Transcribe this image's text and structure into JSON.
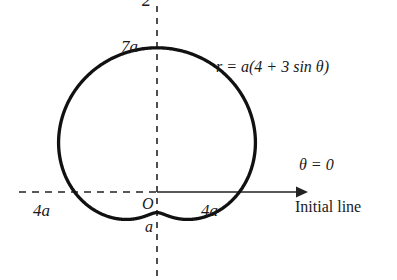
{
  "figure": {
    "kind": "polar-curve-limacon",
    "background_color": "#ffffff",
    "stroke_color": "#111111",
    "axis_color": "#222222",
    "labels": {
      "pi_over_2": "2",
      "max_radius": "7a",
      "equation": "r = a(4 + 3 sin θ)",
      "theta_zero": "θ = 0",
      "initial_line": "Initial line",
      "left_intercept": "4a",
      "origin": "O",
      "right_intercept": "4a",
      "min_radius": "a"
    }
  },
  "chart_data": {
    "type": "line",
    "title": "",
    "subtitle": "",
    "coordinate_system": "polar",
    "equation": "r = a(4 + 3 sin θ)",
    "xlabel": "Initial line",
    "ylabel": "",
    "grid": false,
    "legend_position": "none",
    "axes": [
      {
        "name": "initial-line",
        "label": "θ = 0",
        "direction": "horizontal",
        "style": "dashed-left-solid-right-arrow"
      },
      {
        "name": "pi-over-2-axis",
        "label": "2",
        "direction": "vertical",
        "style": "dashed"
      }
    ],
    "annotations": [
      {
        "text": "7a",
        "meaning": "r at θ = π/2",
        "r": 7,
        "theta_deg": 90
      },
      {
        "text": "4a",
        "meaning": "r at θ = π",
        "r": 4,
        "theta_deg": 180
      },
      {
        "text": "4a",
        "meaning": "r at θ = 0",
        "r": 4,
        "theta_deg": 0
      },
      {
        "text": "a",
        "meaning": "r at θ = 3π/2 (minimum)",
        "r": 1,
        "theta_deg": 270
      },
      {
        "text": "O",
        "meaning": "pole / origin",
        "r": 0,
        "theta_deg": 0
      },
      {
        "text": "r = a(4 + 3 sin θ)",
        "meaning": "curve equation",
        "r": null,
        "theta_deg": null
      }
    ],
    "parameters": {
      "a_coefficient": 4,
      "b_coefficient": 3,
      "scale_symbol": "a"
    },
    "theta_range_deg": [
      0,
      360
    ],
    "r_range": [
      1,
      7
    ],
    "series": [
      {
        "name": "r = a(4 + 3 sin θ)",
        "theta_deg": [
          0,
          15,
          30,
          45,
          60,
          75,
          90,
          105,
          120,
          135,
          150,
          165,
          180,
          195,
          210,
          225,
          240,
          255,
          270,
          285,
          300,
          315,
          330,
          345,
          360
        ],
        "r": [
          4,
          4.78,
          5.5,
          6.12,
          6.6,
          6.9,
          7,
          6.9,
          6.6,
          6.12,
          5.5,
          4.78,
          4,
          3.22,
          2.5,
          1.88,
          1.4,
          1.1,
          1,
          1.1,
          1.4,
          1.88,
          2.5,
          3.22,
          4
        ]
      }
    ]
  }
}
